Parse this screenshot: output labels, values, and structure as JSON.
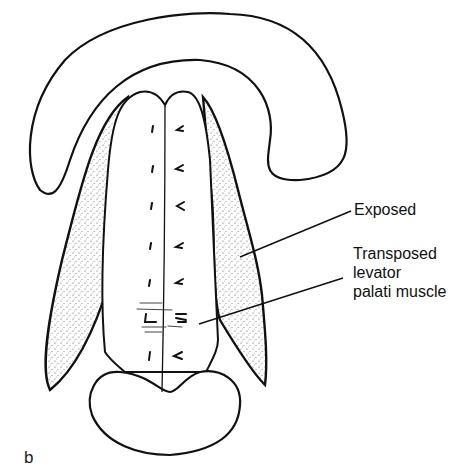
{
  "figure": {
    "panel_label": "b",
    "labels": [
      {
        "id": "exposed",
        "text": "Exposed"
      },
      {
        "id": "muscle_line1",
        "text": "Transposed"
      },
      {
        "id": "muscle_line2",
        "text": "levator"
      },
      {
        "id": "muscle_line3",
        "text": "palati muscle"
      }
    ],
    "caption_fragment": "",
    "colors": {
      "ink": "#111111",
      "background": "#ffffff",
      "stipple": "#555555"
    }
  }
}
